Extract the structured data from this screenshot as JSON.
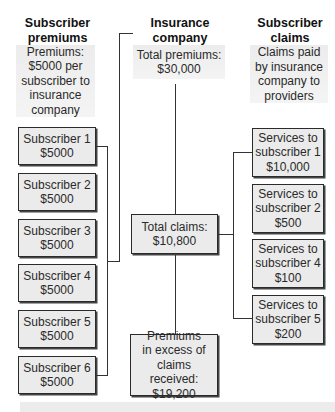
{
  "columns": {
    "left": {
      "header": [
        "Subscriber",
        "premiums"
      ],
      "note": [
        "Premiums:",
        "$5000 per",
        "subscriber to",
        "insurance",
        "company"
      ],
      "boxes": [
        {
          "label": "Subscriber 1",
          "amount": "$5000"
        },
        {
          "label": "Subscriber 2",
          "amount": "$5000"
        },
        {
          "label": "Subscriber 3",
          "amount": "$5000"
        },
        {
          "label": "Subscriber 4",
          "amount": "$5000"
        },
        {
          "label": "Subscriber 5",
          "amount": "$5000"
        },
        {
          "label": "Subscriber 6",
          "amount": "$5000"
        }
      ]
    },
    "middle": {
      "header": [
        "Insurance",
        "company"
      ],
      "total_premiums": [
        "Total premiums:",
        "$30,000"
      ],
      "total_claims": [
        "Total claims:",
        "$10,800"
      ],
      "excess": [
        "Premiums",
        "in excess of",
        "claims received:",
        "$19,200"
      ]
    },
    "right": {
      "header": [
        "Subscriber",
        "claims"
      ],
      "note": [
        "Claims paid",
        "by insurance",
        "company to",
        "providers"
      ],
      "boxes": [
        {
          "line1": "Services to",
          "line2": "subscriber 1",
          "amount": "$10,000"
        },
        {
          "line1": "Services to",
          "line2": "subscriber 2",
          "amount": "$500"
        },
        {
          "line1": "Services to",
          "line2": "subscriber 4",
          "amount": "$100"
        },
        {
          "line1": "Services to",
          "line2": "subscriber 5",
          "amount": "$200"
        }
      ]
    }
  },
  "colors": {
    "box_fill": "#ebebeb",
    "note_fill": "#ededed",
    "line": "#333333"
  }
}
